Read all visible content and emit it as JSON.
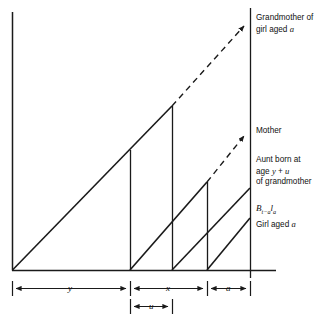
{
  "figure": {
    "type": "lexis-diagram",
    "axes": {
      "left_axis": {
        "x": 12,
        "y_top": 12,
        "y_bottom": 270
      },
      "baseline": {
        "y": 270,
        "x_start": 12,
        "x_end": 275
      },
      "right_axis": {
        "x": 250,
        "y_top": 8,
        "y_bottom": 278
      }
    },
    "cohort_lines": [
      {
        "name": "grandmother",
        "solid": {
          "x1": 12,
          "y1": 270,
          "x2": 172,
          "y2": 106
        },
        "dashed": {
          "x1": 172,
          "y1": 106,
          "x2": 249,
          "y2": 21
        },
        "drop": {
          "x": 172,
          "y1": 106,
          "y2": 270
        },
        "arrow_at_axis": true
      },
      {
        "name": "mother",
        "solid": {
          "x1": 130,
          "y1": 270,
          "x2": 207,
          "y2": 182
        },
        "dashed": {
          "x1": 207,
          "y1": 182,
          "x2": 249,
          "y2": 131
        },
        "drop": {
          "x": 207,
          "y1": 182,
          "y2": 270
        },
        "arrow_at_axis": true
      },
      {
        "name": "aunt",
        "solid": {
          "x1": 172,
          "y1": 270,
          "x2": 249,
          "y2": 188
        },
        "dashed": null,
        "drop": {
          "x": 130,
          "y1": 150,
          "y2": 270
        },
        "arrow_at_axis": false
      },
      {
        "name": "girl",
        "solid": {
          "x1": 207,
          "y1": 270,
          "x2": 249,
          "y2": 218
        },
        "dashed": null,
        "drop": null,
        "arrow_at_axis": false
      }
    ]
  },
  "labels": {
    "grandmother": {
      "line1": "Grandmother of",
      "line2_pre": "girl aged ",
      "line2_var": "a"
    },
    "mother": {
      "text": "Mother"
    },
    "aunt": {
      "line1": "Aunt born at",
      "line2_pre": "age ",
      "line2_v1": "y",
      "line2_mid": " + ",
      "line2_v2": "u",
      "line3": "of grandmother"
    },
    "births": {
      "base": "B",
      "sub1": "t−a",
      "mid": "l",
      "sub2": "a"
    },
    "girl": {
      "pre": "Girl aged ",
      "var": "a"
    }
  },
  "dimensions": {
    "row1": [
      {
        "label": "y",
        "x_start": 12,
        "x_end": 130
      },
      {
        "label": "x",
        "x_start": 130,
        "x_end": 207
      },
      {
        "label": "a",
        "x_start": 207,
        "x_end": 250
      }
    ],
    "row2": [
      {
        "label": "u",
        "x_start": 130,
        "x_end": 172
      }
    ],
    "row1_y": 288,
    "row2_y": 306
  },
  "style": {
    "line_color": "#1a1a1a",
    "text_color": "#111111",
    "background": "#ffffff"
  }
}
